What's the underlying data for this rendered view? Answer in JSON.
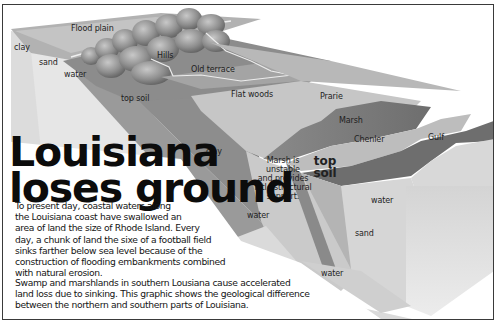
{
  "diagram": {
    "title": "Louisiana\nloses ground",
    "paragraphs": [
      "To present day, coastal waters along\nthe Louisiana coast have swallowed an\narea of land the size of Rhode Island. Every\nday, a chunk of land the sixe of a football field\nsinks farther below sea level because of the\nconstruction of flooding embankments combined\nwith natural erosion.",
      "Swamp and marshlands in southern Lousiana cause accelerated\nland loss due to sinking. This graphic shows the geological difference\nbetween the northern and southern parts of Louisiana."
    ],
    "surface_labels": {
      "flood_plain": "Flood plain",
      "hills": "Hills",
      "old_terrace": "Old terrace",
      "flat_woods": "Flat woods",
      "prarie": "Prarie",
      "marsh": "Marsh",
      "chenler": "Chenler",
      "gulf": "Gulf"
    },
    "layer_labels": {
      "clay_left": "clay",
      "sand_left": "sand",
      "water_left": "water",
      "top_soil_left": "top soil",
      "clay_middle": "clay",
      "water_middle": "water",
      "marsh_note": "Marsh is\nunstable\nand provides\nlittle structural\nsupport.",
      "top_soil_right": "top\nsoil",
      "water_right": "water",
      "sand_right": "sand",
      "water_bottom": "water"
    },
    "colors": {
      "frame_border": "#3a3a3a",
      "surface_dark": "#7c7c7c",
      "surface_mid": "#a8a8a8",
      "surface_light": "#cfcfcf",
      "block_face_light": "#e4e4e4",
      "text": "#151515"
    }
  }
}
